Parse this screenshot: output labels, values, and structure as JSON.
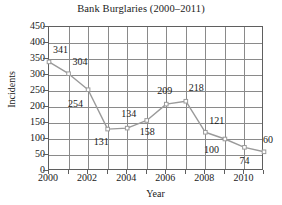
{
  "chart_data": {
    "type": "line",
    "title": "Bank Burglaries (2000–2011)",
    "xlabel": "Year",
    "ylabel": "Incidents",
    "x": [
      2000,
      2001,
      2002,
      2003,
      2004,
      2005,
      2006,
      2007,
      2008,
      2009,
      2010,
      2011
    ],
    "values": [
      341,
      304,
      254,
      131,
      134,
      158,
      209,
      218,
      121,
      100,
      74,
      60
    ],
    "series": [
      {
        "name": "Incidents",
        "values": [
          341,
          304,
          254,
          131,
          134,
          158,
          209,
          218,
          121,
          100,
          74,
          60
        ]
      }
    ],
    "point_labels": [
      "341",
      "304",
      "254",
      "131",
      "134",
      "158",
      "209",
      "218",
      "121",
      "100",
      "74",
      "60"
    ],
    "xlim": [
      2000,
      2011
    ],
    "ylim": [
      0,
      450
    ],
    "ytick_values": [
      0,
      50,
      100,
      150,
      200,
      250,
      300,
      350,
      400,
      450
    ],
    "ytick_labels": [
      "0",
      "50",
      "100",
      "150",
      "200",
      "250",
      "300",
      "350",
      "400",
      "450"
    ],
    "xtick_values": [
      2000,
      2001,
      2002,
      2003,
      2004,
      2005,
      2006,
      2007,
      2008,
      2009,
      2010,
      2011
    ],
    "xtick_labels_shown": [
      "2000",
      "2002",
      "2004",
      "2006",
      "2008",
      "2010"
    ],
    "xtick_labeled_values": [
      2000,
      2002,
      2004,
      2006,
      2008,
      2010
    ],
    "grid": true,
    "legend": "none",
    "line_color": "#9a9a9a",
    "grid_color": "#8a8a8a",
    "axis_color": "#5f5f5f",
    "background_color": "#ffffff",
    "text_color": "#1a1a1a",
    "label_offsets": [
      {
        "value": "341",
        "dx": 4,
        "dy": -12
      },
      {
        "value": "304",
        "dx": 4,
        "dy": -12
      },
      {
        "value": "254",
        "dx": -20,
        "dy": 14
      },
      {
        "value": "131",
        "dx": -14,
        "dy": 13
      },
      {
        "value": "134",
        "dx": -6,
        "dy": -14
      },
      {
        "value": "158",
        "dx": -7,
        "dy": 12
      },
      {
        "value": "209",
        "dx": -9,
        "dy": -13
      },
      {
        "value": "218",
        "dx": 3,
        "dy": -13
      },
      {
        "value": "121",
        "dx": 4,
        "dy": -11
      },
      {
        "value": "100",
        "dx": -21,
        "dy": 11
      },
      {
        "value": "74",
        "dx": -5,
        "dy": 14
      },
      {
        "value": "60",
        "dx": -1,
        "dy": -12
      }
    ]
  }
}
